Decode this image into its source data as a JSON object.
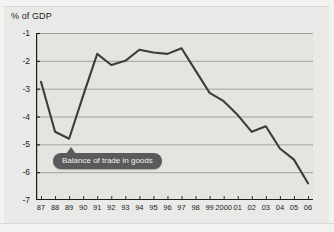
{
  "chart_data": {
    "type": "line",
    "title": "% of GDP",
    "xlabel": "",
    "ylabel": "% of GDP",
    "ylim": [
      -7,
      -1
    ],
    "grid": true,
    "legend_position": "inline-callout",
    "annotations": [
      "Balance of trade in goods"
    ],
    "yticks": [
      "-1",
      "-2",
      "-3",
      "-4",
      "-5",
      "-6",
      "-7"
    ],
    "ytick_values": [
      -1,
      -2,
      -3,
      -4,
      -5,
      -6,
      -7
    ],
    "categories": [
      "87",
      "88",
      "89",
      "90",
      "91",
      "92",
      "93",
      "94",
      "95",
      "96",
      "97",
      "98",
      "99",
      "2000",
      "01",
      "02",
      "03",
      "04",
      "05",
      "06"
    ],
    "series": [
      {
        "name": "Balance of trade in goods",
        "color": "#3c3c3c",
        "values": [
          -2.75,
          -4.55,
          -4.8,
          -3.25,
          -1.75,
          -2.15,
          -2.0,
          -1.6,
          -1.7,
          -1.75,
          -1.55,
          -2.35,
          -3.15,
          -3.45,
          -3.95,
          -4.55,
          -4.35,
          -5.15,
          -5.55,
          -6.4
        ]
      }
    ]
  },
  "callout": {
    "label": "Balance of trade in goods"
  },
  "colors": {
    "line": "#3c3c3c",
    "plot_background": "#e4e4e1",
    "page_background": "#e9e9e7",
    "gridline": "#9a9a97",
    "axis": "#1c1c1c",
    "callout_background": "#5a5a5a",
    "callout_text": "#f2f2f0"
  }
}
